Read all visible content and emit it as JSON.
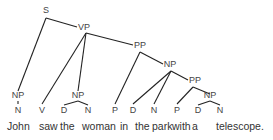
{
  "diagram": {
    "type": "parse-tree",
    "sentence": "John saw the woman in the park with a telescope.",
    "words": [
      "John",
      "saw",
      "the",
      "woman",
      "in",
      "the",
      "park",
      "with",
      "a",
      "telescope."
    ],
    "nodes": [
      {
        "id": "S",
        "label": "S"
      },
      {
        "id": "VP",
        "label": "VP"
      },
      {
        "id": "PP1",
        "label": "PP"
      },
      {
        "id": "NP2",
        "label": "NP"
      },
      {
        "id": "PP2",
        "label": "PP"
      },
      {
        "id": "NP3",
        "label": "NP"
      },
      {
        "id": "NP0",
        "label": "NP"
      },
      {
        "id": "N0",
        "label": "N"
      },
      {
        "id": "V",
        "label": "V"
      },
      {
        "id": "NP1",
        "label": "NP"
      },
      {
        "id": "D1",
        "label": "D"
      },
      {
        "id": "N1",
        "label": "N"
      },
      {
        "id": "P1",
        "label": "P"
      },
      {
        "id": "D2",
        "label": "D"
      },
      {
        "id": "N2",
        "label": "N"
      },
      {
        "id": "P2",
        "label": "P"
      },
      {
        "id": "D3",
        "label": "D"
      },
      {
        "id": "N3",
        "label": "N"
      }
    ],
    "edges": [
      [
        "S",
        "NP0"
      ],
      [
        "S",
        "VP"
      ],
      [
        "NP0",
        "N0"
      ],
      [
        "VP",
        "V"
      ],
      [
        "VP",
        "NP1"
      ],
      [
        "VP",
        "PP1"
      ],
      [
        "NP1",
        "D1"
      ],
      [
        "NP1",
        "N1"
      ],
      [
        "PP1",
        "P1"
      ],
      [
        "PP1",
        "NP2"
      ],
      [
        "NP2",
        "D2"
      ],
      [
        "NP2",
        "N2"
      ],
      [
        "NP2",
        "PP2"
      ],
      [
        "PP2",
        "P2"
      ],
      [
        "PP2",
        "NP3"
      ],
      [
        "NP3",
        "D3"
      ],
      [
        "NP3",
        "N3"
      ]
    ]
  }
}
